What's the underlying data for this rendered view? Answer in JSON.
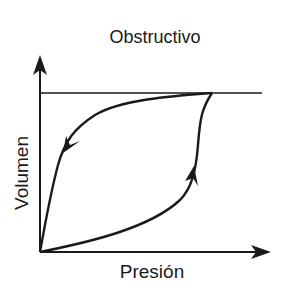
{
  "diagram": {
    "title": "Obstructivo",
    "x_axis_label": "Presión",
    "y_axis_label": "Volumen",
    "type": "pressure-volume loop",
    "curves": [
      {
        "name": "inspiration",
        "direction": "up (origin to peak)",
        "arrow": "up"
      },
      {
        "name": "expiration",
        "direction": "down (peak to origin)",
        "arrow": "down-left"
      }
    ],
    "reference_line": "horizontal line at maximum volume"
  },
  "colors": {
    "stroke": "#1a1a1a",
    "background": "#ffffff"
  }
}
